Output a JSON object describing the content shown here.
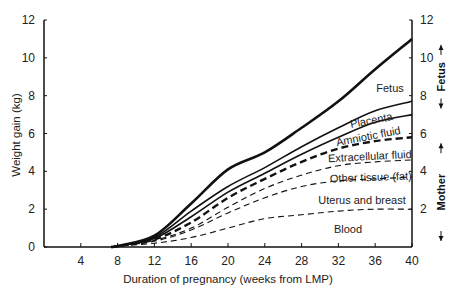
{
  "chart_data": {
    "type": "line",
    "title": "",
    "xlabel": "Duration of pregnancy (weeks from LMP)",
    "ylabel": "Weight gain (kg)",
    "xlim": [
      0,
      40
    ],
    "ylim": [
      0,
      12
    ],
    "x_ticks": [
      4,
      8,
      12,
      16,
      20,
      24,
      28,
      32,
      36,
      40
    ],
    "y_ticks": [
      0,
      2,
      4,
      6,
      8,
      10,
      12
    ],
    "right_y_ticks": [
      2,
      4,
      6,
      8,
      10,
      12
    ],
    "grid": false,
    "legend": "inline band labels",
    "x": [
      8,
      12,
      16,
      20,
      24,
      28,
      32,
      36,
      40
    ],
    "series": [
      {
        "name": "Fetus (total weight gain)",
        "style": "solid-thick",
        "values": [
          0.0,
          0.6,
          2.3,
          4.1,
          5.0,
          6.3,
          7.7,
          9.4,
          11.0
        ]
      },
      {
        "name": "Placenta",
        "style": "solid",
        "values": [
          0.0,
          0.5,
          1.9,
          3.2,
          4.2,
          5.3,
          6.3,
          7.2,
          7.7
        ]
      },
      {
        "name": "Amniotic fluid",
        "style": "solid",
        "values": [
          0.0,
          0.45,
          1.6,
          2.9,
          3.9,
          4.9,
          5.8,
          6.6,
          7.0
        ]
      },
      {
        "name": "Extracellular fluid",
        "style": "dashed-thick",
        "values": [
          0.0,
          0.4,
          1.3,
          2.6,
          3.6,
          4.5,
          5.2,
          5.6,
          5.8
        ]
      },
      {
        "name": "Other tissue (fat)",
        "style": "dashed",
        "values": [
          0.0,
          0.35,
          1.0,
          2.1,
          3.1,
          3.8,
          4.3,
          4.5,
          4.6
        ]
      },
      {
        "name": "Uterus and breast",
        "style": "dashed",
        "values": [
          0.0,
          0.3,
          0.9,
          1.8,
          2.6,
          3.2,
          3.5,
          3.6,
          3.7
        ]
      },
      {
        "name": "Blood",
        "style": "dashed",
        "values": [
          0.0,
          0.2,
          0.5,
          1.0,
          1.5,
          1.7,
          1.9,
          2.0,
          2.0
        ]
      }
    ],
    "band_labels": [
      {
        "text": "Fetus",
        "x": 390,
        "y": 92,
        "rotate": 0
      },
      {
        "text": "Placenta",
        "x": 372,
        "y": 124,
        "rotate": -11
      },
      {
        "text": "Amniotic fluid",
        "x": 369,
        "y": 140,
        "rotate": -11
      },
      {
        "text": "Extracellular fluid",
        "x": 370,
        "y": 160,
        "rotate": -3
      },
      {
        "text": "Other tissue (fat)",
        "x": 371,
        "y": 181,
        "rotate": -2
      },
      {
        "text": "Uterus and breast",
        "x": 362,
        "y": 204,
        "rotate": 0
      },
      {
        "text": "Blood",
        "x": 348,
        "y": 233,
        "rotate": 0
      }
    ],
    "side_brackets": [
      {
        "label": "Fetus",
        "from_kg": 7.0,
        "to_kg": 11.0
      },
      {
        "label": "Mother",
        "from_kg": 0,
        "to_kg": 5.8
      }
    ]
  }
}
